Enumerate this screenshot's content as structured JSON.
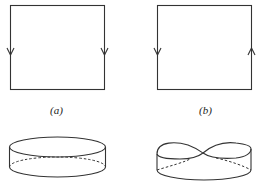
{
  "figures": {
    "a": {
      "label": "(a)",
      "description": "Square with both vertical edges oriented downward (cylinder identification)",
      "left_arrow": "down",
      "right_arrow": "down"
    },
    "b": {
      "label": "(b)",
      "description": "Square with vertical edges oriented oppositely (Möbius strip identification)",
      "left_arrow": "down",
      "right_arrow": "up"
    },
    "c": {
      "description": "Cylinder (annulus band) resulting from (a)"
    },
    "d": {
      "description": "Möbius band resulting from (b)"
    }
  },
  "colors": {
    "stroke": "#333333",
    "background": "#ffffff"
  }
}
